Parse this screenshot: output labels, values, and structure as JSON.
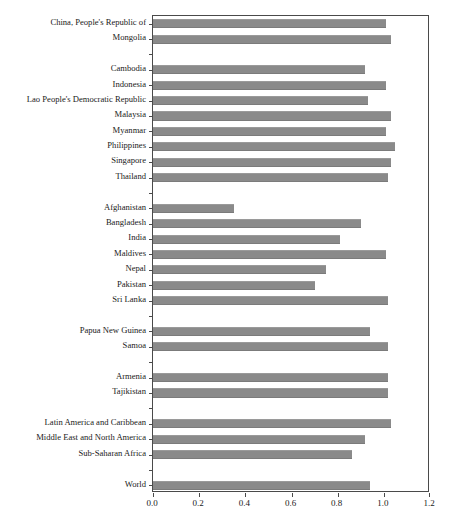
{
  "chart": {
    "title_partial": "",
    "axis": {
      "frame_color": "#4a4a4a",
      "bar_color": "#8a8a8a"
    }
  },
  "chart_data": {
    "type": "bar",
    "orientation": "horizontal",
    "title": "",
    "xlabel": "",
    "ylabel": "",
    "xlim": [
      0.0,
      1.2
    ],
    "xticks": [
      "0.0",
      "0.2",
      "0.4",
      "0.6",
      "0.8",
      "1.0",
      "1.2"
    ],
    "xtick_values": [
      0.0,
      0.2,
      0.4,
      0.6,
      0.8,
      1.0,
      1.2
    ],
    "grid": false,
    "legend": null,
    "categories": [
      "China, People's Republic of",
      "Mongolia",
      "",
      "Cambodia",
      "Indonesia",
      "Lao People's Democratic Republic",
      "Malaysia",
      "Myanmar",
      "Philippines",
      "Singapore",
      "Thailand",
      "",
      "Afghanistan",
      "Bangladesh",
      "India",
      "Maldives",
      "Nepal",
      "Pakistan",
      "Sri Lanka",
      "",
      "Papua New Guinea",
      "Samoa",
      "",
      "Armenia",
      "Tajikistan",
      "",
      "Latin America and Caribbean",
      "Middle East and North America",
      "Sub-Saharan Africa",
      "",
      "World"
    ],
    "values": [
      1.01,
      1.03,
      null,
      0.92,
      1.01,
      0.93,
      1.03,
      1.01,
      1.05,
      1.03,
      1.02,
      null,
      0.35,
      0.9,
      0.81,
      1.01,
      0.75,
      0.7,
      1.02,
      null,
      0.94,
      1.02,
      null,
      1.02,
      1.02,
      null,
      1.03,
      0.92,
      0.86,
      null,
      0.94
    ]
  }
}
